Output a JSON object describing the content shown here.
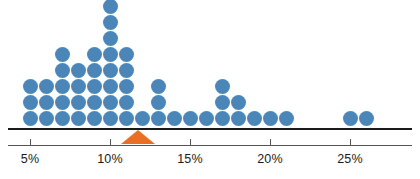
{
  "chart_data": {
    "type": "scatter",
    "subtype": "dot-plot",
    "title": "",
    "subtitle": "",
    "xlabel": "",
    "ylabel": "",
    "xlim": [
      3.5,
      27.5
    ],
    "grid": false,
    "legend": null,
    "dot_color": "#4a87b8",
    "marker_color": "#ea6f24",
    "axis_color": "#555555",
    "baseline_color": "#1a1a1a",
    "x_unit": "percent",
    "tick_labels": [
      "5%",
      "10%",
      "15%",
      "20%",
      "25%"
    ],
    "tick_values": [
      5,
      10,
      15,
      20,
      25
    ],
    "categories": [
      5,
      6,
      7,
      8,
      9,
      10,
      11,
      12,
      13,
      14,
      15,
      16,
      17,
      18,
      19,
      20,
      21,
      25,
      26
    ],
    "values": [
      3,
      3,
      5,
      4,
      5,
      8,
      5,
      1,
      3,
      1,
      1,
      1,
      3,
      2,
      1,
      1,
      1,
      1,
      1
    ],
    "annotations": [
      {
        "name": "mean-marker",
        "shape": "triangle-up",
        "x": 11.75,
        "color": "#ea6f24",
        "label": ""
      }
    ]
  }
}
